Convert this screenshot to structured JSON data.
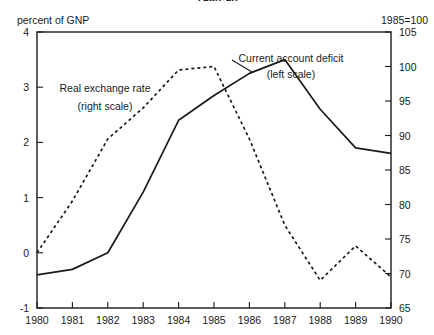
{
  "title": "1980-90",
  "header": {
    "left_unit": "percent of GNP",
    "right_unit": "1985=100"
  },
  "chart_data": {
    "type": "line",
    "title": "1980-90",
    "xlabel": "",
    "ylabel": "percent of GNP",
    "y2label": "1985=100",
    "x": [
      1980,
      1981,
      1982,
      1983,
      1984,
      1985,
      1986,
      1987,
      1988,
      1989,
      1990
    ],
    "xticklabels": [
      "1980",
      "1981",
      "1982",
      "1983",
      "1984",
      "1985",
      "1986",
      "1987",
      "1988",
      "1989",
      "1990"
    ],
    "xlim": [
      1980,
      1990
    ],
    "ylim": [
      -1,
      4
    ],
    "yticks": [
      -1,
      0,
      1,
      2,
      3,
      4
    ],
    "yticklabels": [
      "-1",
      "0",
      "1",
      "2",
      "3",
      "4"
    ],
    "y2lim": [
      65,
      105
    ],
    "y2ticks": [
      65,
      70,
      75,
      80,
      85,
      90,
      95,
      100,
      105
    ],
    "y2ticklabels": [
      "65",
      "70",
      "75",
      "80",
      "85",
      "90",
      "95",
      "100",
      "105"
    ],
    "grid": false,
    "legend": "inline-annotations",
    "series": [
      {
        "name": "Current account deficit",
        "scale_label": "(left scale)",
        "axis": "left",
        "style": "solid",
        "color": "#1a1a1a",
        "values": [
          -0.4,
          -0.3,
          0.0,
          1.1,
          2.4,
          2.85,
          3.25,
          3.5,
          2.6,
          1.9,
          1.8
        ]
      },
      {
        "name": "Real exchange rate",
        "scale_label": "(right scale)",
        "axis": "right",
        "style": "dashed",
        "color": "#1a1a1a",
        "values": [
          73.0,
          80.5,
          89.5,
          94.0,
          99.5,
          100.0,
          89.5,
          77.0,
          69.0,
          74.0,
          69.5
        ]
      }
    ],
    "annotations": [
      {
        "id": "annot-current-account",
        "line1": "Current account deficit",
        "line2": "(left scale)"
      },
      {
        "id": "annot-real-exchange",
        "line1": "Real exchange rate",
        "line2": "(right scale)"
      }
    ]
  }
}
